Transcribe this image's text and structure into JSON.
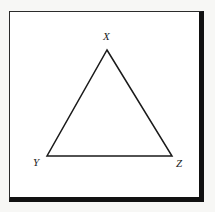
{
  "figure": {
    "kind": "geometry-diagram",
    "shape_name": "triangle",
    "frame": {
      "border_color": "#111111",
      "fill_color": "#ffffff",
      "outer_background": "#f7f7f5"
    },
    "triangle": {
      "stroke_color": "#1a1a1a",
      "fill": "none",
      "stroke_width": 1.5,
      "points": "107,50 172,156 47,156"
    },
    "vertices": [
      {
        "id": "X",
        "label": "X",
        "role": "apex",
        "x": 107,
        "y": 50
      },
      {
        "id": "Y",
        "label": "Y",
        "role": "bottom-left",
        "x": 47,
        "y": 156
      },
      {
        "id": "Z",
        "label": "Z",
        "role": "bottom-right",
        "x": 172,
        "y": 156
      }
    ]
  }
}
